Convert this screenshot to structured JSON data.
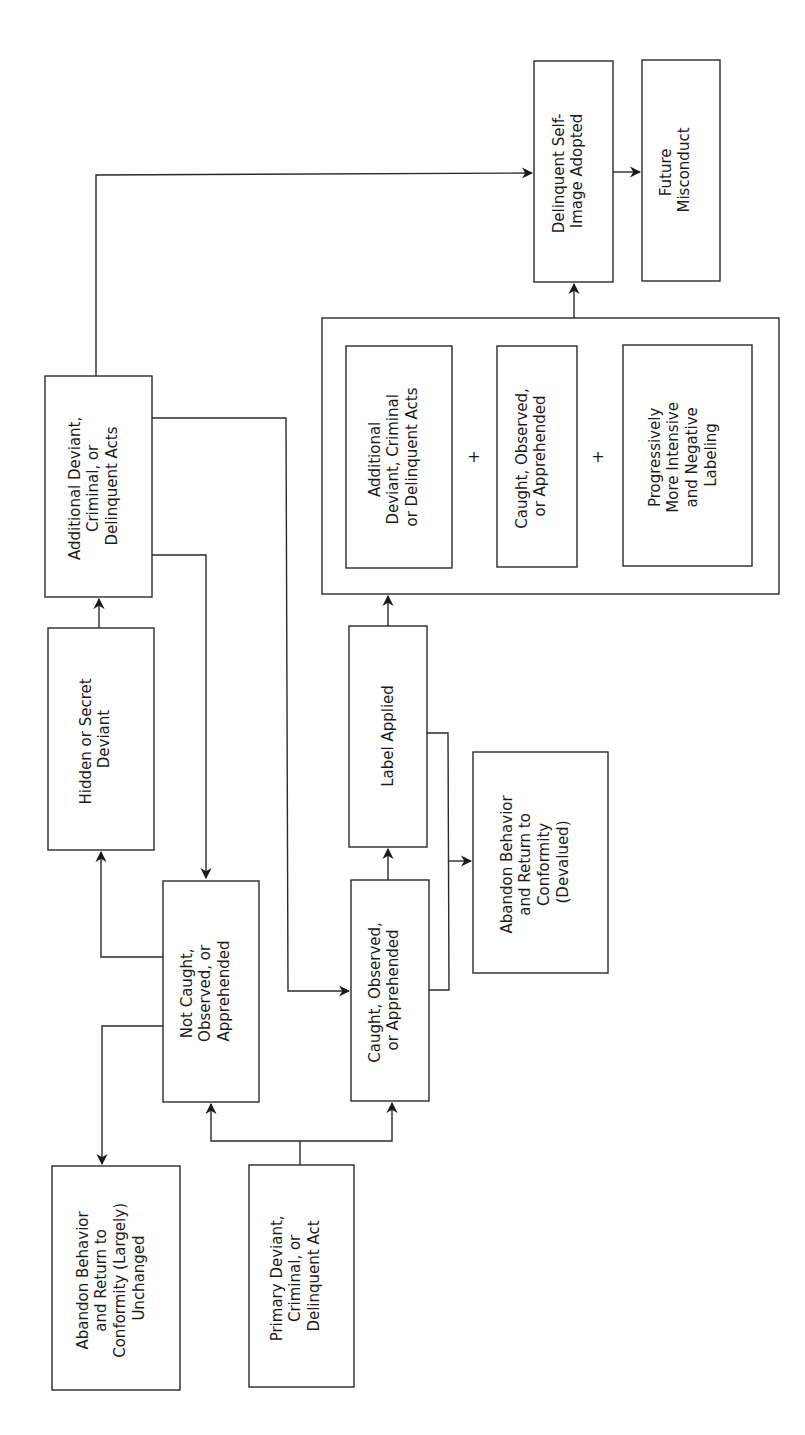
{
  "diagram": {
    "orientation": "rotated -90deg (text reads bottom-to-top)",
    "nodes": {
      "primary": {
        "lines": [
          "Primary Deviant,",
          "Criminal, or",
          "Delinquent Act"
        ]
      },
      "abandon_unchanged": {
        "lines": [
          "Abandon Behavior",
          "and Return to",
          "Conformity (Largely)",
          "Unchanged"
        ]
      },
      "not_caught": {
        "lines": [
          "Not Caught,",
          "Observed, or",
          "Apprehended"
        ]
      },
      "caught": {
        "lines": [
          "Caught, Observed,",
          "or Apprehended"
        ]
      },
      "hidden": {
        "lines": [
          "Hidden or Secret",
          "Deviant"
        ]
      },
      "additional": {
        "lines": [
          "Additional Deviant,",
          "Criminal, or",
          "Delinquent Acts"
        ]
      },
      "label_applied": {
        "lines": [
          "Label Applied"
        ]
      },
      "abandon_devalued": {
        "lines": [
          "Abandon Behavior",
          "and Return to",
          "Conformity",
          "(Devalued)"
        ]
      },
      "group_additional": {
        "lines": [
          "Additional",
          "Deviant, Criminal",
          "or Delinquent Acts"
        ]
      },
      "group_caught": {
        "lines": [
          "Caught, Observed,",
          "or Apprehended"
        ]
      },
      "group_labeling": {
        "lines": [
          "Progressively",
          "More Intensive",
          "and Negative",
          "Labeling"
        ]
      },
      "self_image": {
        "lines": [
          "Delinquent Self-",
          "Image Adopted"
        ]
      },
      "future": {
        "lines": [
          "Future",
          "Misconduct"
        ]
      }
    },
    "plus_signs": [
      "+",
      "+"
    ],
    "edges": [
      {
        "from": "primary",
        "to": "not_caught"
      },
      {
        "from": "primary",
        "to": "caught"
      },
      {
        "from": "not_caught",
        "to": "hidden"
      },
      {
        "from": "not_caught",
        "to": "abandon_unchanged"
      },
      {
        "from": "hidden",
        "to": "additional"
      },
      {
        "from": "additional",
        "to": "not_caught"
      },
      {
        "from": "additional",
        "to": "caught"
      },
      {
        "from": "additional",
        "to": "self_image"
      },
      {
        "from": "caught",
        "to": "label_applied"
      },
      {
        "from": "caught",
        "to": "abandon_devalued"
      },
      {
        "from": "label_applied",
        "to": "abandon_devalued"
      },
      {
        "from": "label_applied",
        "to": "group"
      },
      {
        "from": "group",
        "to": "self_image"
      },
      {
        "from": "self_image",
        "to": "future"
      }
    ]
  }
}
